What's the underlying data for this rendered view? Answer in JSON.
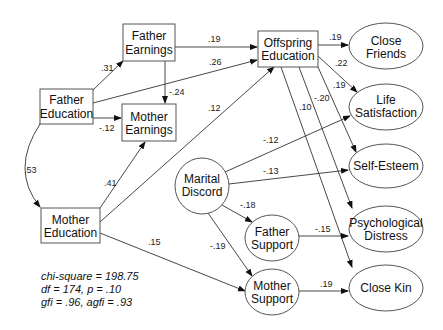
{
  "diagram": {
    "type": "path-diagram",
    "observed_nodes": [
      {
        "id": "father_earnings",
        "lines": [
          "Father",
          "Earnings"
        ]
      },
      {
        "id": "father_education",
        "lines": [
          "Father",
          "Education"
        ]
      },
      {
        "id": "mother_earnings",
        "lines": [
          "Mother",
          "Earnings"
        ]
      },
      {
        "id": "mother_education",
        "lines": [
          "Mother",
          "Education"
        ]
      },
      {
        "id": "offspring_education",
        "lines": [
          "Offspring",
          "Education"
        ]
      }
    ],
    "latent_nodes": [
      {
        "id": "close_friends",
        "lines": [
          "Close",
          "Friends"
        ]
      },
      {
        "id": "life_satisfaction",
        "lines": [
          "Life",
          "Satisfaction"
        ]
      },
      {
        "id": "self_esteem",
        "lines": [
          "Self-Esteem"
        ]
      },
      {
        "id": "psychological_distress",
        "lines": [
          "Psychological",
          "Distress"
        ]
      },
      {
        "id": "close_kin",
        "lines": [
          "Close Kin"
        ]
      },
      {
        "id": "marital_discord",
        "lines": [
          "Marital",
          "Discord"
        ]
      },
      {
        "id": "father_support",
        "lines": [
          "Father",
          "Support"
        ]
      },
      {
        "id": "mother_support",
        "lines": [
          "Mother",
          "Support"
        ]
      }
    ],
    "paths": [
      {
        "from": "father_education",
        "to": "father_earnings",
        "coef": ".31"
      },
      {
        "from": "father_education",
        "to": "mother_earnings",
        "coef": "-.12"
      },
      {
        "from": "father_education",
        "to": "offspring_education",
        "coef": ".26"
      },
      {
        "from": "father_earnings",
        "to": "offspring_education",
        "coef": ".19"
      },
      {
        "from": "father_earnings",
        "to": "mother_earnings",
        "coef": "-.24"
      },
      {
        "from": "mother_education",
        "to": "mother_earnings",
        "coef": ".41"
      },
      {
        "from": "mother_education",
        "to": "offspring_education",
        "coef": ".12"
      },
      {
        "from": "mother_education",
        "to": "mother_support",
        "coef": ".15"
      },
      {
        "from": "father_education",
        "to": "mother_education",
        "coef": ".53",
        "type": "covariance"
      },
      {
        "from": "offspring_education",
        "to": "close_friends",
        "coef": ".19"
      },
      {
        "from": "offspring_education",
        "to": "life_satisfaction",
        "coef": ".22"
      },
      {
        "from": "offspring_education",
        "to": "self_esteem",
        "coef": ".19"
      },
      {
        "from": "offspring_education",
        "to": "psychological_distress",
        "coef": "-.20"
      },
      {
        "from": "offspring_education",
        "to": "close_kin",
        "coef": ".10"
      },
      {
        "from": "marital_discord",
        "to": "life_satisfaction",
        "coef": "-.12"
      },
      {
        "from": "marital_discord",
        "to": "self_esteem",
        "coef": "-.13"
      },
      {
        "from": "marital_discord",
        "to": "father_support",
        "coef": "-.18"
      },
      {
        "from": "marital_discord",
        "to": "mother_support",
        "coef": "-.19"
      },
      {
        "from": "father_support",
        "to": "psychological_distress",
        "coef": "-.15"
      },
      {
        "from": "mother_support",
        "to": "close_kin",
        "coef": ".19"
      }
    ]
  },
  "labels": {
    "father_earnings": [
      "Father",
      "Earnings"
    ],
    "father_education": [
      "Father",
      "Education"
    ],
    "mother_earnings": [
      "Mother",
      "Earnings"
    ],
    "mother_education": [
      "Mother",
      "Education"
    ],
    "offspring_education": [
      "Offspring",
      "Education"
    ],
    "close_friends": [
      "Close",
      "Friends"
    ],
    "life_satisfaction": [
      "Life",
      "Satisfaction"
    ],
    "self_esteem": "Self-Esteem",
    "psychological_distress": [
      "Psychological",
      "Distress"
    ],
    "close_kin": "Close Kin",
    "marital_discord": [
      "Marital",
      "Discord"
    ],
    "father_support": [
      "Father",
      "Support"
    ],
    "mother_support": [
      "Mother",
      "Support"
    ]
  },
  "coefs": {
    "fed_fearn": ".31",
    "fed_mearn": "-.12",
    "fed_off": ".26",
    "fearn_off": ".19",
    "fearn_mearn": "-.24",
    "med_mearn": ".41",
    "med_off": ".12",
    "med_msup": ".15",
    "fed_med_cov": ".53",
    "off_cf": ".19",
    "off_ls": ".22",
    "off_se": ".19",
    "off_pd": "-.20",
    "off_ck": ".10",
    "md_ls": "-.12",
    "md_se": "-.13",
    "md_fs": "-.18",
    "md_ms": "-.19",
    "fs_pd": "-.15",
    "ms_ck": ".19"
  },
  "fit": {
    "line1": "chi-square = 198.75",
    "line2": "df = 174, p = .10",
    "line3": "gfi = .96, agfi = .93"
  }
}
